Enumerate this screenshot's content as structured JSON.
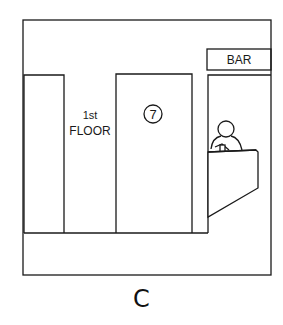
{
  "scene": {
    "floor_sign": {
      "line1": "1st",
      "line2": "FLOOR"
    },
    "door_number": "7",
    "bar_sign": "BAR",
    "figure": "bartender behind counter"
  },
  "caption": "C",
  "colors": {
    "line": "#1a1a1a",
    "background": "#ffffff"
  }
}
